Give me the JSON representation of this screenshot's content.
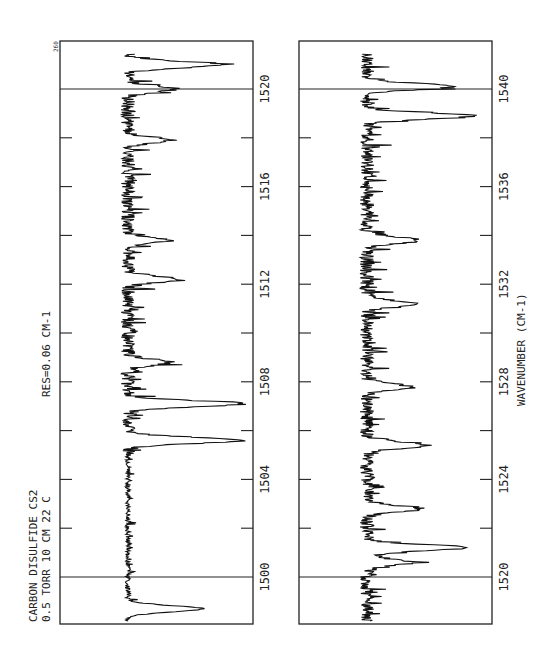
{
  "chart_data": [
    {
      "type": "line",
      "panel": "upper",
      "title": "CARBON DISULFIDE  CS2",
      "annotations": [
        "0.5 TORR  10 CM  22 C",
        "RES=0.06 CM-1",
        "260"
      ],
      "xlabel": "",
      "ylabel": "",
      "xlim": [
        1498,
        1521.5
      ],
      "tick_labels": [
        "1500",
        "1504",
        "1508",
        "1512",
        "1516",
        "1520"
      ],
      "tick_values": [
        1500,
        1502,
        1504,
        1506,
        1508,
        1510,
        1512,
        1514,
        1516,
        1518,
        1520
      ],
      "boundary_markers": [
        1500,
        1520
      ],
      "grid": false,
      "orientation": "rotated 90 degrees (wavenumber increases upward)",
      "peaks": [
        {
          "x": 1498.7,
          "depth": 0.62
        },
        {
          "x": 1505.6,
          "depth": 0.95
        },
        {
          "x": 1507.1,
          "depth": 0.95
        },
        {
          "x": 1508.8,
          "depth": 0.35
        },
        {
          "x": 1512.2,
          "depth": 0.42
        },
        {
          "x": 1513.8,
          "depth": 0.3
        },
        {
          "x": 1517.9,
          "depth": 0.35
        },
        {
          "x": 1520.0,
          "depth": 0.4
        },
        {
          "x": 1521.0,
          "depth": 0.78
        }
      ]
    },
    {
      "type": "line",
      "panel": "lower",
      "title": "",
      "xlabel": "WAVENUMBER (CM-1)",
      "ylabel": "",
      "xlim": [
        1518,
        1541.5
      ],
      "tick_labels": [
        "1520",
        "1524",
        "1528",
        "1532",
        "1536",
        "1540"
      ],
      "tick_values": [
        1520,
        1522,
        1524,
        1526,
        1528,
        1530,
        1532,
        1534,
        1536,
        1538,
        1540
      ],
      "boundary_markers": [
        1520,
        1540
      ],
      "grid": false,
      "orientation": "rotated 90 degrees (wavenumber increases upward)",
      "peaks": [
        {
          "x": 1520.6,
          "depth": 0.38
        },
        {
          "x": 1521.2,
          "depth": 0.82
        },
        {
          "x": 1522.8,
          "depth": 0.45
        },
        {
          "x": 1525.4,
          "depth": 0.5
        },
        {
          "x": 1527.8,
          "depth": 0.35
        },
        {
          "x": 1531.2,
          "depth": 0.38
        },
        {
          "x": 1533.8,
          "depth": 0.45
        },
        {
          "x": 1538.9,
          "depth": 0.88
        },
        {
          "x": 1540.1,
          "depth": 0.72
        }
      ]
    }
  ],
  "labels": {
    "sample": "CARBON DISULFIDE  CS2",
    "conditions": "0.5 TORR  10 CM  22 C",
    "resolution": "RES=0.06 CM-1",
    "page_marker": "260",
    "axis_title": "WAVENUMBER (CM-1)",
    "upper_ticks": [
      "1500",
      "1504",
      "1508",
      "1512",
      "1516",
      "1520"
    ],
    "lower_ticks": [
      "1520",
      "1524",
      "1528",
      "1532",
      "1536",
      "1540"
    ]
  }
}
